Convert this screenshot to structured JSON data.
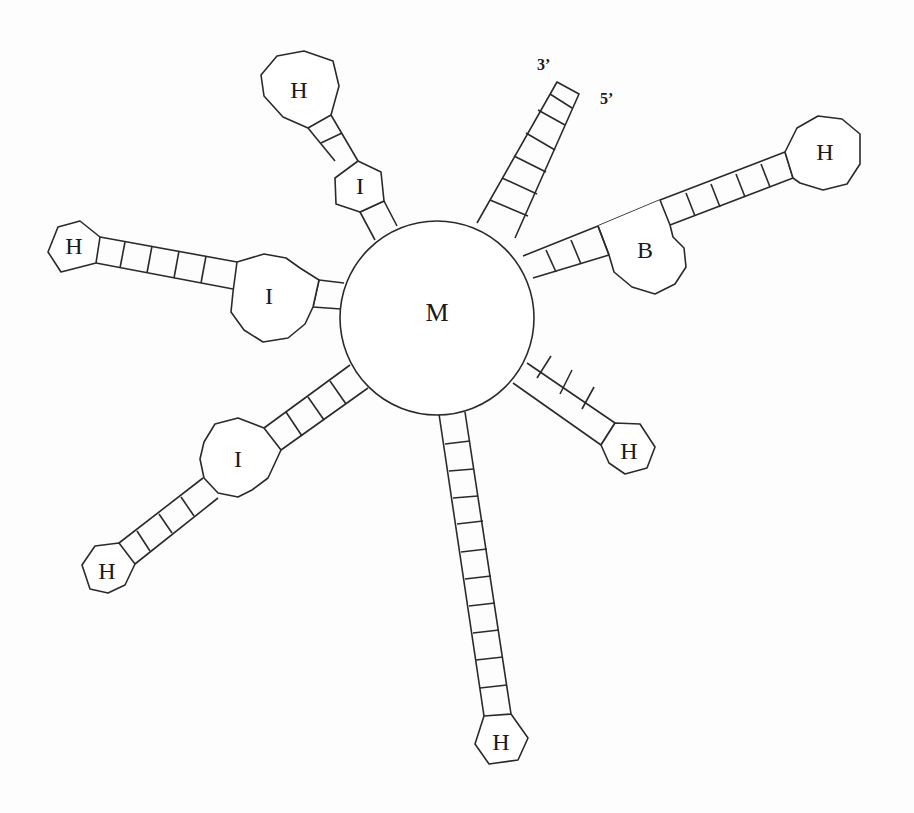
{
  "diagram": {
    "type": "rna-secondary-structure-schematic",
    "colors": {
      "stroke": "#2a2a2a",
      "background": "#fdfdfd"
    },
    "multiloop": {
      "label": "M",
      "cx": 437,
      "cy": 318,
      "r": 97
    },
    "ends": {
      "three_prime": "3’",
      "five_prime": "5’"
    },
    "legend_labels": {
      "M": "Multiloop",
      "H": "Hairpin loop",
      "I": "Internal loop",
      "B": "Bulge"
    },
    "branches": [
      {
        "name": "exterior-stem",
        "pairs": 6,
        "terminal": "open-ends"
      },
      {
        "name": "branch-upper-right",
        "stems": [
          3,
          6
        ],
        "internal": "B",
        "terminal": "H"
      },
      {
        "name": "branch-right",
        "stems": [
          4
        ],
        "terminal": "H"
      },
      {
        "name": "branch-bottom",
        "stems": [
          11
        ],
        "terminal": "H"
      },
      {
        "name": "branch-lower-left",
        "stems": [
          4,
          4
        ],
        "internal": "I",
        "terminal": "H"
      },
      {
        "name": "branch-left",
        "stems": [
          2,
          5
        ],
        "internal": "I",
        "terminal": "H"
      },
      {
        "name": "branch-upper-left",
        "stems": [
          1,
          2
        ],
        "internal": "I",
        "terminal": "H"
      }
    ]
  },
  "labels": {
    "M": "M",
    "H1": "H",
    "H2": "H",
    "H3": "H",
    "H4": "H",
    "H5": "H",
    "H6": "H",
    "I1": "I",
    "I2": "I",
    "I3": "I",
    "B1": "B",
    "three": "3’",
    "five": "5’"
  }
}
